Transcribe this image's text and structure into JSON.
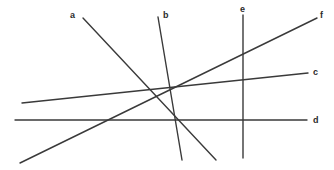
{
  "figure": {
    "type": "line-diagram",
    "width": 334,
    "height": 170,
    "background_color": "#ffffff",
    "stroke_color": "#3a3a3a",
    "stroke_width": 1.4,
    "label_color": "#2b2b2b"
  },
  "chart_data": {
    "type": "line",
    "title": "",
    "subtitle": "",
    "xlabel": "",
    "ylabel": "",
    "grid": false,
    "legend": "inline-endpoint-labels",
    "xlim": [
      0,
      334
    ],
    "ylim": [
      170,
      0
    ],
    "series": [
      {
        "name": "a",
        "label": "a",
        "x": [
          83,
          216
        ],
        "y": [
          18,
          160
        ],
        "label_x": 70,
        "label_y": 11,
        "orientation": "descending-right"
      },
      {
        "name": "b",
        "label": "b",
        "x": [
          158,
          182
        ],
        "y": [
          17,
          160
        ],
        "label_x": 163,
        "label_y": 11,
        "orientation": "steep-descending-right"
      },
      {
        "name": "c",
        "label": "c",
        "x": [
          22,
          308
        ],
        "y": [
          103,
          73
        ],
        "label_x": 313,
        "label_y": 68,
        "orientation": "shallow-ascending-right"
      },
      {
        "name": "d",
        "label": "d",
        "x": [
          15,
          307
        ],
        "y": [
          120,
          120
        ],
        "label_x": 313,
        "label_y": 116,
        "orientation": "horizontal"
      },
      {
        "name": "e",
        "label": "e",
        "x": [
          243,
          243
        ],
        "y": [
          15,
          158
        ],
        "label_x": 240,
        "label_y": 5,
        "orientation": "vertical"
      },
      {
        "name": "f",
        "label": "f",
        "x": [
          20,
          317
        ],
        "y": [
          163,
          18
        ],
        "label_x": 320,
        "label_y": 11,
        "orientation": "ascending-right"
      }
    ]
  }
}
